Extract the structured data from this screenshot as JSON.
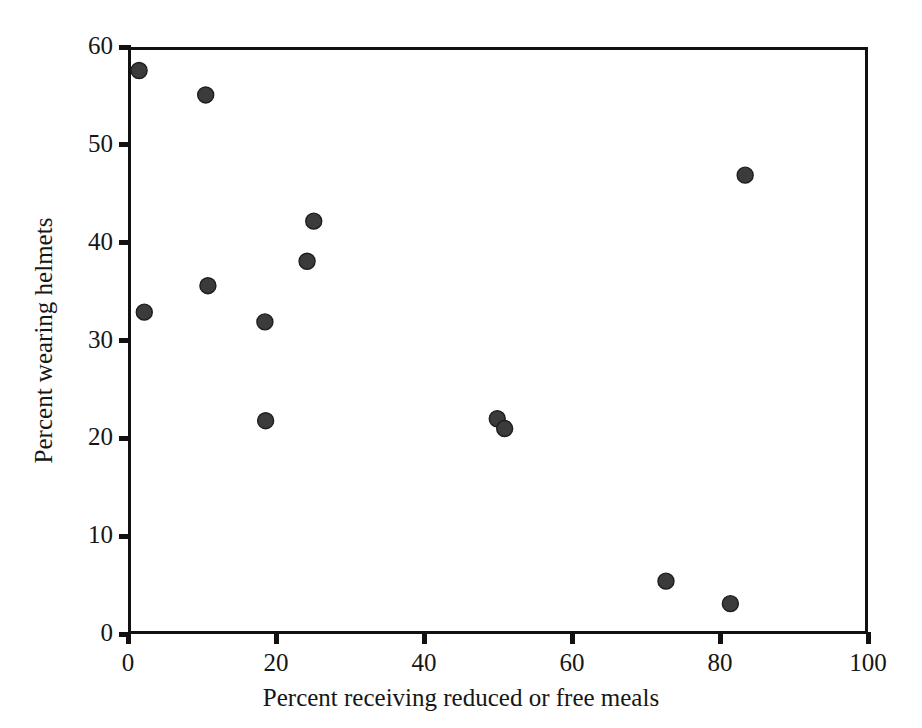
{
  "chart_data": {
    "type": "scatter",
    "title": "",
    "xlabel": "Percent receiving reduced or free meals",
    "ylabel": "Percent wearing helmets",
    "xlim": [
      0,
      100
    ],
    "ylim": [
      0,
      60
    ],
    "xticks": [
      0,
      20,
      40,
      60,
      80,
      100
    ],
    "yticks": [
      0,
      10,
      20,
      30,
      40,
      50,
      60
    ],
    "xticklabels": [
      "0",
      "20",
      "40",
      "60",
      "80",
      "100"
    ],
    "yticklabels": [
      "0",
      "10",
      "20",
      "30",
      "40",
      "50",
      "60"
    ],
    "grid": false,
    "legend": null,
    "marker": {
      "shape": "circle",
      "color": "#3b3b3b",
      "edge_color": "#1e1e1e",
      "size_px": 16
    },
    "frame": {
      "box": true,
      "color": "#111111",
      "width_px": 3
    },
    "points": [
      {
        "x": 1.5,
        "y": 57.6
      },
      {
        "x": 10.5,
        "y": 55.1
      },
      {
        "x": 83.4,
        "y": 46.9
      },
      {
        "x": 25.1,
        "y": 42.2
      },
      {
        "x": 24.2,
        "y": 38.1
      },
      {
        "x": 10.8,
        "y": 35.6
      },
      {
        "x": 2.2,
        "y": 32.9
      },
      {
        "x": 18.5,
        "y": 31.9
      },
      {
        "x": 18.6,
        "y": 21.8
      },
      {
        "x": 49.9,
        "y": 22.0
      },
      {
        "x": 50.9,
        "y": 21.0
      },
      {
        "x": 72.7,
        "y": 5.4
      },
      {
        "x": 81.4,
        "y": 3.1
      }
    ]
  }
}
